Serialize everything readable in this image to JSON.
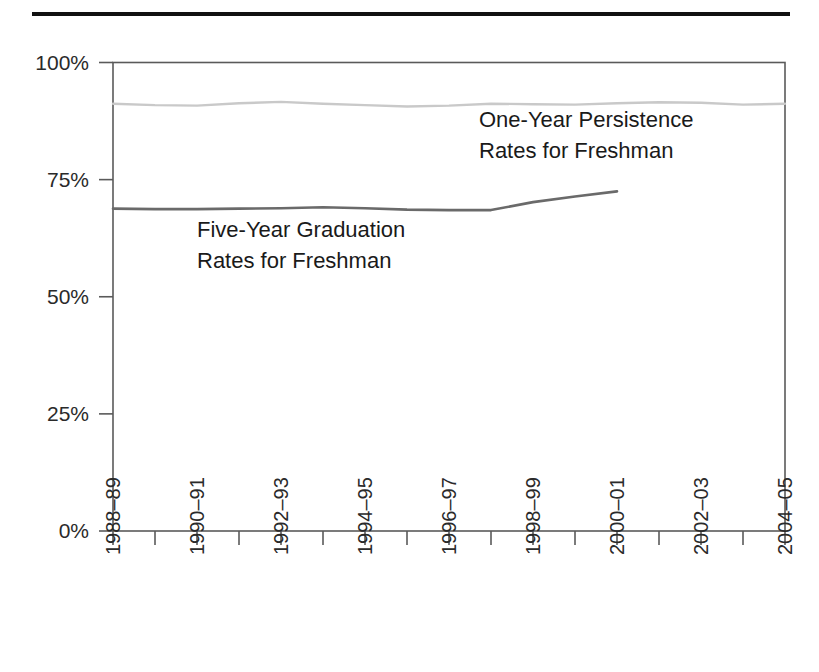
{
  "chart_data": {
    "type": "line",
    "title": "",
    "subtitle": "",
    "xlabel": "",
    "ylabel": "",
    "ylim": [
      0,
      100
    ],
    "yticks": [
      0,
      25,
      50,
      75,
      100
    ],
    "ytick_labels": [
      "0%",
      "25%",
      "50%",
      "75%",
      "100%"
    ],
    "grid": false,
    "legend_position": "inline-annotation",
    "x": [
      "1988–89",
      "1989–90",
      "1990–91",
      "1991–92",
      "1992–93",
      "1993–94",
      "1994–95",
      "1995–96",
      "1996–97",
      "1997–98",
      "1998–99",
      "1999–00",
      "2000–01",
      "2001–02",
      "2002–03",
      "2003–04",
      "2004–05"
    ],
    "xtick_labels_shown": [
      "1988–89",
      "",
      "1990–91",
      "",
      "1992–93",
      "",
      "1994–95",
      "",
      "1996–97",
      "",
      "1998–99",
      "",
      "2000–01",
      "",
      "2002–03",
      "",
      "2004–05"
    ],
    "series": [
      {
        "name": "One-Year Persistence Rates for Freshman",
        "color": "#c9c9c9",
        "values": [
          91.2,
          90.9,
          90.8,
          91.3,
          91.6,
          91.2,
          90.9,
          90.6,
          90.8,
          91.2,
          91.1,
          91.0,
          91.3,
          91.5,
          91.4,
          91.0,
          91.2
        ]
      },
      {
        "name": "Five-Year Graduation Rates for Freshman",
        "color": "#6a6a6a",
        "values": [
          68.8,
          68.7,
          68.7,
          68.8,
          68.9,
          69.1,
          68.9,
          68.6,
          68.5,
          68.5,
          70.2,
          71.4,
          72.5,
          null,
          null,
          null,
          null
        ]
      }
    ],
    "annotations": [
      {
        "id": "persistence-label",
        "lines": [
          "One-Year Persistence",
          "Rates for Freshman"
        ]
      },
      {
        "id": "graduation-label",
        "lines": [
          "Five-Year Graduation",
          "Rates for Freshman"
        ]
      }
    ]
  }
}
